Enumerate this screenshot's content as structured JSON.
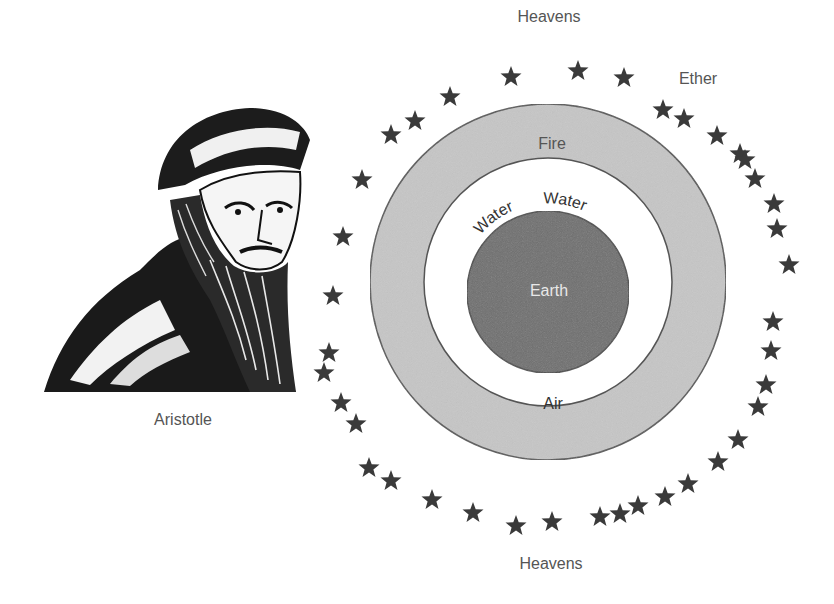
{
  "figure": {
    "name": "Aristotle",
    "caption": "Aristotle"
  },
  "labels": {
    "heavens_top": "Heavens",
    "heavens_bottom": "Heavens",
    "ether": "Ether",
    "fire": "Fire",
    "water_left": "Water",
    "water_right": "Water",
    "earth": "Earth",
    "air": "Air"
  },
  "spheres": [
    {
      "name": "Fire",
      "radius": 178,
      "fill": "#c4c4c4"
    },
    {
      "name": "Air",
      "radius": 124,
      "fill": "#ffffff"
    },
    {
      "name": "Earth",
      "radius": 81,
      "fill": "#6b6b6b"
    }
  ],
  "colors": {
    "star": "#3a3a3a",
    "text": "#555555",
    "earth_text": "#e6e6e6",
    "outline": "#555555"
  },
  "stars": [
    [
      511,
      77
    ],
    [
      578,
      71
    ],
    [
      624,
      78
    ],
    [
      450,
      97
    ],
    [
      415,
      121
    ],
    [
      391,
      135
    ],
    [
      663,
      110
    ],
    [
      684,
      119
    ],
    [
      717,
      136
    ],
    [
      740,
      154
    ],
    [
      745,
      160
    ],
    [
      755,
      179
    ],
    [
      362,
      180
    ],
    [
      774,
      204
    ],
    [
      777,
      229
    ],
    [
      343,
      237
    ],
    [
      789,
      265
    ],
    [
      333,
      296
    ],
    [
      773,
      322
    ],
    [
      771,
      351
    ],
    [
      329,
      353
    ],
    [
      324,
      373
    ],
    [
      766,
      385
    ],
    [
      758,
      407
    ],
    [
      341,
      403
    ],
    [
      356,
      424
    ],
    [
      738,
      440
    ],
    [
      718,
      462
    ],
    [
      369,
      468
    ],
    [
      391,
      481
    ],
    [
      688,
      484
    ],
    [
      432,
      500
    ],
    [
      665,
      497
    ],
    [
      473,
      513
    ],
    [
      638,
      506
    ],
    [
      620,
      514
    ],
    [
      600,
      517
    ],
    [
      516,
      526
    ],
    [
      552,
      522
    ]
  ]
}
